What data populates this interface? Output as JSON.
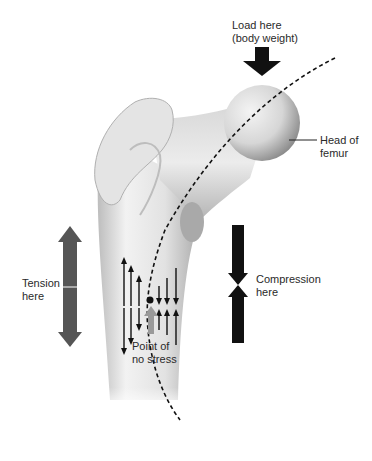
{
  "figure": {
    "labels": {
      "load": [
        "Load here",
        "(body weight)"
      ],
      "head": [
        "Head of",
        "femur"
      ],
      "tension": [
        "Tension",
        "here"
      ],
      "compression": [
        "Compression",
        "here"
      ],
      "neutral": [
        "Point of",
        "no stress"
      ]
    },
    "colors": {
      "bone_light": "#eeeeee",
      "bone_shadow": "#a8a8a8",
      "tension_arrow": "#555555",
      "compression_arrow": "#1a1a1a",
      "neutral_arrow": "#9a9a9a",
      "dashed_line": "#111111"
    }
  }
}
